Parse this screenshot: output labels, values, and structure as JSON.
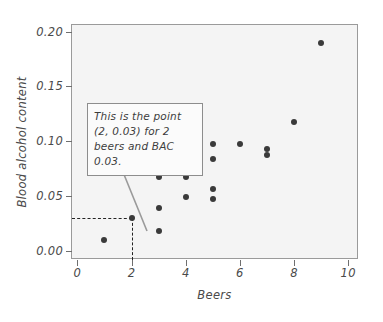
{
  "chart_data": {
    "type": "scatter",
    "title": "",
    "xlabel": "Beers",
    "ylabel": "Blood alcohol content",
    "xlim": [
      -0.2,
      10.4
    ],
    "ylim": [
      -0.008,
      0.206
    ],
    "xticks": [
      "0",
      "2",
      "4",
      "6",
      "8",
      "10"
    ],
    "xtick_values": [
      0,
      2,
      4,
      6,
      8,
      10
    ],
    "yticks": [
      "0.00",
      "0.05",
      "0.10",
      "0.15",
      "0.20"
    ],
    "ytick_values": [
      0.0,
      0.05,
      0.1,
      0.15,
      0.2
    ],
    "grid": false,
    "legend": null,
    "marker_color": "#3a3a3a",
    "plot_background": "#f4f4f4",
    "points": [
      {
        "x": 1,
        "y": 0.01
      },
      {
        "x": 2,
        "y": 0.03
      },
      {
        "x": 3,
        "y": 0.018
      },
      {
        "x": 3,
        "y": 0.039
      },
      {
        "x": 3,
        "y": 0.068
      },
      {
        "x": 4,
        "y": 0.049
      },
      {
        "x": 4,
        "y": 0.068
      },
      {
        "x": 5,
        "y": 0.048
      },
      {
        "x": 5,
        "y": 0.057
      },
      {
        "x": 5,
        "y": 0.084
      },
      {
        "x": 5,
        "y": 0.098
      },
      {
        "x": 6,
        "y": 0.098
      },
      {
        "x": 7,
        "y": 0.088
      },
      {
        "x": 7,
        "y": 0.093
      },
      {
        "x": 8,
        "y": 0.118
      },
      {
        "x": 9,
        "y": 0.19
      }
    ],
    "annotation": {
      "text": "This is the point (2, 0.03) for 2 beers and BAC 0.03.",
      "lines": [
        "This is the point",
        "(2, 0.03) for 2",
        "beers and BAC 0.03."
      ],
      "target_point": {
        "x": 2,
        "y": 0.03
      },
      "guide_lines": "dashed"
    }
  }
}
